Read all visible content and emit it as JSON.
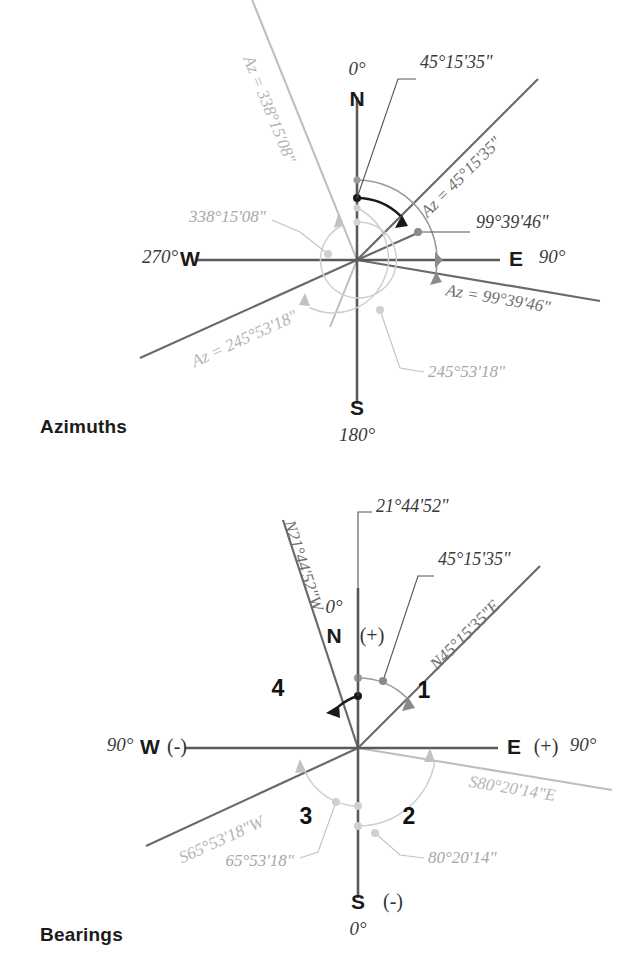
{
  "page": {
    "width": 630,
    "height": 979,
    "background": "#ffffff"
  },
  "figures": [
    {
      "id": "azimuths",
      "caption": "Azimuths",
      "center": {
        "x": 357,
        "y": 260
      },
      "cardinals": {
        "north_letter": "N",
        "north_value": "0°",
        "east_letter": "E",
        "east_value": "90°",
        "south_letter": "S",
        "south_value": "180°",
        "west_letter": "W",
        "west_value": "270°"
      },
      "rays": [
        {
          "name": "ray-az-45",
          "azimuth_deg": 45.26,
          "label": "Az = 45°15'35\"",
          "callout": "45°15'35\"",
          "tone": "mid"
        },
        {
          "name": "ray-az-99",
          "azimuth_deg": 99.66,
          "label": "Az = 99°39'46\"",
          "callout": "99°39'46\"",
          "tone": "mid"
        },
        {
          "name": "ray-az-245",
          "azimuth_deg": 245.89,
          "label": "Az = 245°53'18\"",
          "callout": "245°53'18\"",
          "tone": "mid"
        },
        {
          "name": "ray-az-338",
          "azimuth_deg": 338.25,
          "label": "Az = 338°15'08\"",
          "callout": "338°15'08\"",
          "tone": "faint"
        }
      ]
    },
    {
      "id": "bearings",
      "caption": "Bearings",
      "center": {
        "x": 358,
        "y": 748
      },
      "cardinals": {
        "north_letter": "N",
        "north_sign": "(+)",
        "north_value": "0°",
        "east_letter": "E",
        "east_sign": "(+)",
        "east_value": "90°",
        "south_letter": "S",
        "south_sign": "(-)",
        "south_value": "0°",
        "west_letter": "W",
        "west_sign": "(-)",
        "west_value": "90°"
      },
      "quadrants": [
        {
          "name": "quadrant-1",
          "label": "1"
        },
        {
          "name": "quadrant-2",
          "label": "2"
        },
        {
          "name": "quadrant-3",
          "label": "3"
        },
        {
          "name": "quadrant-4",
          "label": "4"
        }
      ],
      "rays": [
        {
          "name": "ray-bearing-n45e",
          "azimuth_deg": 45.26,
          "label": "N45°15'35\"E",
          "callout": "45°15'35\"",
          "tone": "mid"
        },
        {
          "name": "ray-bearing-s80e",
          "azimuth_deg": 99.66,
          "label": "S80°20'14\"E",
          "callout": "80°20'14\"",
          "tone": "faint"
        },
        {
          "name": "ray-bearing-s65w",
          "azimuth_deg": 245.89,
          "label": "S65°53'18\"W",
          "callout": "65°53'18\"",
          "tone": "faint"
        },
        {
          "name": "ray-bearing-n21w",
          "azimuth_deg": 338.25,
          "label": "N21°44'52\"W",
          "callout": "21°44'52\"",
          "tone": "dark"
        }
      ]
    }
  ],
  "colors": {
    "axis": "#5a5a5a",
    "ray": "#6a6a6a",
    "ray_faint": "#bdbdbd",
    "arc_dark": "#1a1a1a",
    "text_dark": "#1b1b1b",
    "text_mid": "#555555",
    "text_faint": "#b4b4b4"
  }
}
